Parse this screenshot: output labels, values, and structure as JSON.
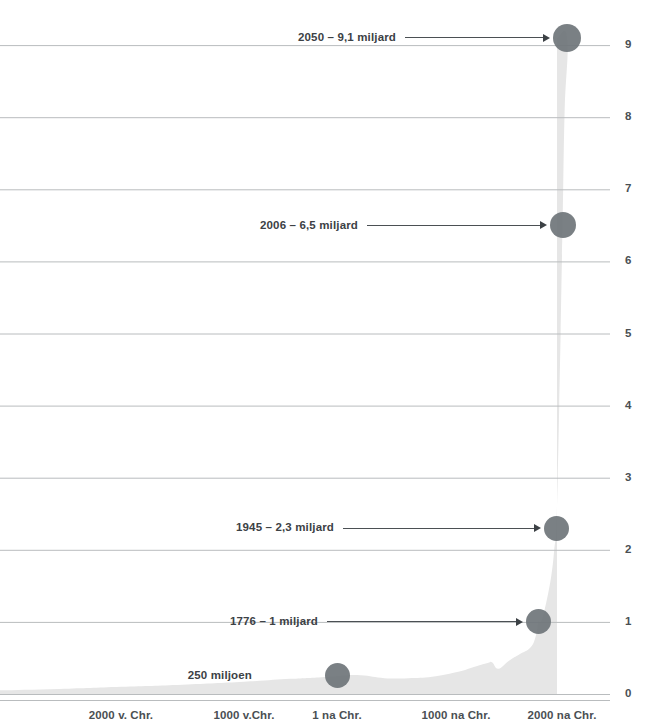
{
  "chart_data": {
    "type": "area",
    "title": "",
    "subtitle": "",
    "xlabel": "",
    "ylabel": "",
    "ylim": [
      0,
      9.4
    ],
    "yticks": [
      0,
      1,
      2,
      3,
      4,
      5,
      6,
      7,
      8,
      9
    ],
    "ytick_labels": [
      "0",
      "1",
      "2",
      "3",
      "4",
      "5",
      "6",
      "7",
      "8",
      "9"
    ],
    "xlim": [
      -3000,
      2100
    ],
    "xticks": [
      -2000,
      -1000,
      1,
      1000,
      2000
    ],
    "xtick_labels": [
      "2000 v. Chr.",
      "1000 v.Chr.",
      "1 na Chr.",
      "1000 na Chr.",
      "2000 na Chr."
    ],
    "grid": true,
    "legend": "none",
    "series": [
      {
        "name": "Wereldbevolking (miljard)",
        "x": [
          -3000,
          -2500,
          -2000,
          -1500,
          -1000,
          -500,
          -200,
          1,
          200,
          400,
          600,
          800,
          1000,
          1200,
          1300,
          1340,
          1400,
          1500,
          1600,
          1700,
          1750,
          1776,
          1800,
          1850,
          1900,
          1927,
          1945,
          1960,
          1974,
          1987,
          1999,
          2006,
          2011,
          2025,
          2050
        ],
        "values": [
          0.05,
          0.07,
          0.1,
          0.13,
          0.17,
          0.21,
          0.23,
          0.25,
          0.26,
          0.22,
          0.22,
          0.24,
          0.3,
          0.39,
          0.43,
          0.44,
          0.35,
          0.46,
          0.55,
          0.64,
          0.79,
          1.0,
          1.0,
          1.26,
          1.65,
          2.0,
          2.3,
          3.0,
          4.0,
          5.0,
          6.0,
          6.5,
          7.0,
          8.1,
          9.1
        ]
      }
    ],
    "annotations": [
      {
        "id": "a2050",
        "label": "2050 – 9,1 miljard",
        "year": 2050,
        "value": 9.1,
        "arrow": true
      },
      {
        "id": "a2006",
        "label": "2006 – 6,5 miljard",
        "year": 2006,
        "value": 6.5,
        "arrow": true
      },
      {
        "id": "a1945",
        "label": "1945 – 2,3 miljard",
        "year": 1945,
        "value": 2.3,
        "arrow": true
      },
      {
        "id": "a1776",
        "label": "1776 – 1 miljard",
        "year": 1776,
        "value": 1.0,
        "arrow": true
      },
      {
        "id": "a250",
        "label": "250 miljoen",
        "year": 1,
        "value": 0.25,
        "arrow": false
      }
    ],
    "colors": {
      "area_fill": "#e6e6e6",
      "gridline": "#b9bcbe",
      "marker": "#6f7579",
      "text": "#3c4145",
      "background": "#ffffff"
    }
  }
}
